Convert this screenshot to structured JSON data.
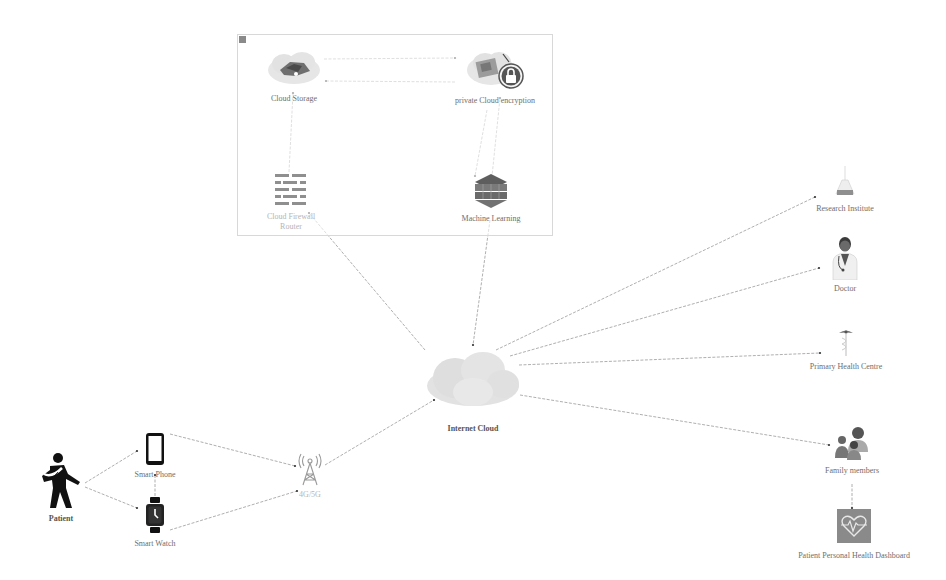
{
  "diagram": {
    "title": "",
    "cloud_group": {
      "corner_label": "",
      "nodes": {
        "cloud_storage": {
          "label": "Cloud Storage",
          "icon": "cloud-storage-icon"
        },
        "private_cloud": {
          "label": "private Cloud encryption",
          "icon": "lock-cloud-icon"
        },
        "firewall": {
          "label_line1": "Cloud Firewall",
          "label_line2": "Router",
          "icon": "firewall-icon"
        },
        "machine_learning": {
          "label": "Machine Learning",
          "icon": "layers-icon"
        }
      }
    },
    "nodes": {
      "internet_cloud": {
        "label": "Internet Cloud",
        "icon": "cloud-icon"
      },
      "patient": {
        "label": "Patient",
        "icon": "person-with-arm-sling-icon"
      },
      "smart_phone": {
        "label": "Smart Phone",
        "icon": "smartphone-icon"
      },
      "smart_watch": {
        "label": "Smart Watch",
        "icon": "smartwatch-icon"
      },
      "network_tower": {
        "label": "4G/5G",
        "icon": "cell-tower-icon"
      },
      "research_institute": {
        "label": "Research Institute",
        "icon": "flask-icon"
      },
      "doctor": {
        "label": "Doctor",
        "icon": "doctor-icon"
      },
      "primary_health_centre": {
        "label": "Primary Health Centre",
        "icon": "caduceus-icon"
      },
      "family_members": {
        "label": "Family members",
        "icon": "family-icon"
      },
      "dashboard": {
        "label": "Patient Personal Health Dashboard",
        "icon": "heart-monitor-icon"
      }
    },
    "edges": [
      {
        "from": "Cloud Storage",
        "to": "private Cloud encryption"
      },
      {
        "from": "private Cloud encryption",
        "to": "Cloud Storage"
      },
      {
        "from": "Cloud Firewall Router",
        "to": "Cloud Storage"
      },
      {
        "from": "private Cloud encryption",
        "to": "Machine Learning"
      },
      {
        "from": "Machine Learning",
        "to": "private Cloud encryption"
      },
      {
        "from": "Internet Cloud",
        "to": "Cloud Firewall Router"
      },
      {
        "from": "Machine Learning",
        "to": "Internet Cloud"
      },
      {
        "from": "Internet Cloud",
        "to": "Research Institute"
      },
      {
        "from": "Internet Cloud",
        "to": "Doctor"
      },
      {
        "from": "Internet Cloud",
        "to": "Primary Health Centre"
      },
      {
        "from": "Internet Cloud",
        "to": "Family members"
      },
      {
        "from": "Family members",
        "to": "Patient Personal Health Dashboard"
      },
      {
        "from": "Patient",
        "to": "Smart Phone"
      },
      {
        "from": "Patient",
        "to": "Smart Watch"
      },
      {
        "from": "Smart Watch",
        "to": "Smart Phone"
      },
      {
        "from": "Smart Phone",
        "to": "4G/5G"
      },
      {
        "from": "Smart Watch",
        "to": "4G/5G"
      },
      {
        "from": "4G/5G",
        "to": "Internet Cloud"
      }
    ],
    "colors": {
      "edge": "#9a9a9a",
      "edge_arrow": "#333333",
      "group_border": "#d8d8d8",
      "icon_dark": "#1a1a1a",
      "icon_gray": "#8c8c8c",
      "cloud_fill": "#e3e3e3",
      "dashboard_fill": "#8a8a8a"
    }
  }
}
